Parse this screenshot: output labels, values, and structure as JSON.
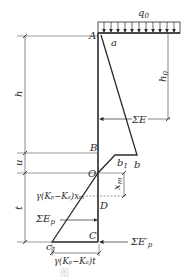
{
  "figure": {
    "type": "earth-pressure diagram (sheet pile / retaining wall)",
    "labels": {
      "q0": "q",
      "q0_sub": "0",
      "A": "A",
      "a": "a",
      "h0": "h",
      "h0_sub": "0",
      "h": "h",
      "sumE": "ΣE",
      "B": "B",
      "b": "b",
      "b1": "b",
      "b1_sub": "1",
      "u": "u",
      "O": "O",
      "xm": "x",
      "xm_sub": "m",
      "t": "t",
      "gamma_xm": "γ(Kₚ−Kₐ)xₘ",
      "D": "D",
      "sumEp": "ΣE",
      "sumEp_sub": "p",
      "C": "C",
      "c1": "c",
      "c1_sub": "1",
      "sumEp_prime": "ΣE′",
      "sumEp_prime_sub": "p",
      "gamma_t": "γ(Kₚ−Kₐ)t"
    },
    "caption": "图"
  },
  "colors": {
    "line": "#2a2a2a",
    "dim": "#555555"
  }
}
